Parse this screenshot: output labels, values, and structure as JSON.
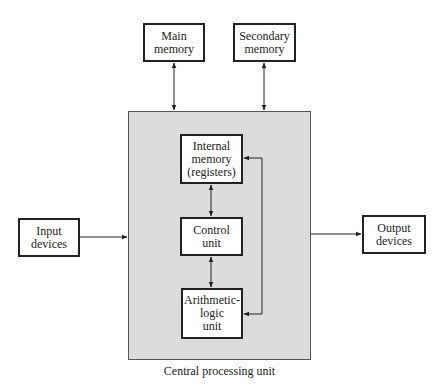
{
  "diagram": {
    "title": "Central processing unit",
    "nodes": {
      "main_memory": "Main\nmemory",
      "secondary_memory": "Secondary\nmemory",
      "internal_memory": "Internal\nmemory\n(registers)",
      "control_unit": "Control\nunit",
      "alu": "Arithmetic-\nlogic\nunit",
      "input_devices": "Input\ndevices",
      "output_devices": "Output\ndevices"
    },
    "edges": [
      {
        "from": "main_memory",
        "to": "cpu",
        "direction": "bidirectional"
      },
      {
        "from": "secondary_memory",
        "to": "cpu",
        "direction": "bidirectional"
      },
      {
        "from": "internal_memory",
        "to": "control_unit",
        "direction": "bidirectional"
      },
      {
        "from": "control_unit",
        "to": "alu",
        "direction": "bidirectional"
      },
      {
        "from": "internal_memory",
        "to": "alu",
        "direction": "bidirectional"
      },
      {
        "from": "input_devices",
        "to": "cpu",
        "direction": "forward"
      },
      {
        "from": "cpu",
        "to": "output_devices",
        "direction": "forward"
      }
    ],
    "colors": {
      "cpu_fill": "#dcdcdc",
      "box_fill": "#ffffff",
      "stroke": "#222222"
    }
  }
}
